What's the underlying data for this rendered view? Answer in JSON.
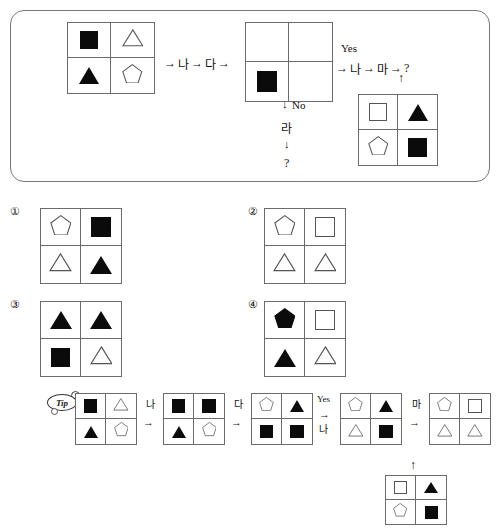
{
  "meta": {
    "doc_type": "korean-aptitude-flowchart-question",
    "colors": {
      "ink": "#111111",
      "line": "#6b6b6b",
      "fill_black": "#0b0b0b",
      "fill_white": "#ffffff"
    }
  },
  "panel": {
    "start_grid": {
      "name": "start-grid",
      "cells": [
        {
          "shape": "square",
          "fill": "black"
        },
        {
          "shape": "triangle",
          "fill": "white"
        },
        {
          "shape": "triangle",
          "fill": "black"
        },
        {
          "shape": "pentagon",
          "fill": "white"
        }
      ]
    },
    "chain1": {
      "arrow1": "→",
      "op1": "나",
      "arrow2": "→",
      "op2": "다",
      "arrow3": "→"
    },
    "middle_grid": {
      "name": "decision-grid",
      "cells": [
        {
          "shape": "none",
          "fill": "white"
        },
        {
          "shape": "none",
          "fill": "white"
        },
        {
          "shape": "square",
          "fill": "black"
        },
        {
          "shape": "none",
          "fill": "white"
        }
      ]
    },
    "yes_label": "Yes",
    "chain2": {
      "arrow1": "→",
      "op1": "나",
      "arrow2": "→",
      "op2": "마",
      "arrow3": "→",
      "question": "?"
    },
    "up_arrow": "↑",
    "no_branch": {
      "down_arrow1": "↓",
      "no_label": "No",
      "op": "라",
      "down_arrow2": "↓",
      "question": "?"
    },
    "ref_grid": {
      "name": "reference-grid",
      "cells": [
        {
          "shape": "square",
          "fill": "white"
        },
        {
          "shape": "triangle",
          "fill": "black"
        },
        {
          "shape": "pentagon",
          "fill": "white"
        },
        {
          "shape": "square",
          "fill": "black"
        }
      ]
    }
  },
  "options": [
    {
      "number": "①",
      "name": "option-1",
      "cells": [
        {
          "shape": "pentagon",
          "fill": "white"
        },
        {
          "shape": "square",
          "fill": "black"
        },
        {
          "shape": "triangle",
          "fill": "white"
        },
        {
          "shape": "triangle",
          "fill": "black"
        }
      ]
    },
    {
      "number": "②",
      "name": "option-2",
      "cells": [
        {
          "shape": "pentagon",
          "fill": "white"
        },
        {
          "shape": "square",
          "fill": "white"
        },
        {
          "shape": "triangle",
          "fill": "white"
        },
        {
          "shape": "triangle",
          "fill": "white"
        }
      ]
    },
    {
      "number": "③",
      "name": "option-3",
      "cells": [
        {
          "shape": "triangle",
          "fill": "black"
        },
        {
          "shape": "triangle",
          "fill": "black"
        },
        {
          "shape": "square",
          "fill": "black"
        },
        {
          "shape": "triangle",
          "fill": "white"
        }
      ]
    },
    {
      "number": "④",
      "name": "option-4",
      "cells": [
        {
          "shape": "pentagon",
          "fill": "black"
        },
        {
          "shape": "square",
          "fill": "white"
        },
        {
          "shape": "triangle",
          "fill": "black"
        },
        {
          "shape": "triangle",
          "fill": "white"
        }
      ]
    }
  ],
  "tip": {
    "badge_label": "Tip",
    "steps": [
      {
        "op": "",
        "arrow": ""
      },
      {
        "op": "나",
        "arrow": "→"
      },
      {
        "op": "다",
        "arrow": "→"
      },
      {
        "op_top": "Yes",
        "op": "나",
        "arrow": "→"
      },
      {
        "op": "마",
        "arrow": "→"
      }
    ],
    "grids": [
      {
        "name": "tip-grid-1",
        "cells": [
          {
            "shape": "square",
            "fill": "black"
          },
          {
            "shape": "triangle",
            "fill": "white"
          },
          {
            "shape": "triangle",
            "fill": "black"
          },
          {
            "shape": "pentagon",
            "fill": "white"
          }
        ]
      },
      {
        "name": "tip-grid-2",
        "cells": [
          {
            "shape": "square",
            "fill": "black"
          },
          {
            "shape": "square",
            "fill": "black"
          },
          {
            "shape": "triangle",
            "fill": "black"
          },
          {
            "shape": "pentagon",
            "fill": "white"
          }
        ]
      },
      {
        "name": "tip-grid-3",
        "cells": [
          {
            "shape": "pentagon",
            "fill": "white"
          },
          {
            "shape": "triangle",
            "fill": "black"
          },
          {
            "shape": "square",
            "fill": "black"
          },
          {
            "shape": "square",
            "fill": "black"
          }
        ]
      },
      {
        "name": "tip-grid-4",
        "cells": [
          {
            "shape": "pentagon",
            "fill": "white"
          },
          {
            "shape": "triangle",
            "fill": "black"
          },
          {
            "shape": "triangle",
            "fill": "white"
          },
          {
            "shape": "square",
            "fill": "black"
          }
        ]
      },
      {
        "name": "tip-grid-5",
        "cells": [
          {
            "shape": "pentagon",
            "fill": "white"
          },
          {
            "shape": "square",
            "fill": "white"
          },
          {
            "shape": "triangle",
            "fill": "white"
          },
          {
            "shape": "triangle",
            "fill": "white"
          }
        ]
      }
    ],
    "bottom_grid": {
      "name": "tip-bottom-grid",
      "up_arrow": "↑",
      "cells": [
        {
          "shape": "square",
          "fill": "white"
        },
        {
          "shape": "triangle",
          "fill": "black"
        },
        {
          "shape": "pentagon",
          "fill": "white"
        },
        {
          "shape": "square",
          "fill": "black"
        }
      ]
    }
  }
}
